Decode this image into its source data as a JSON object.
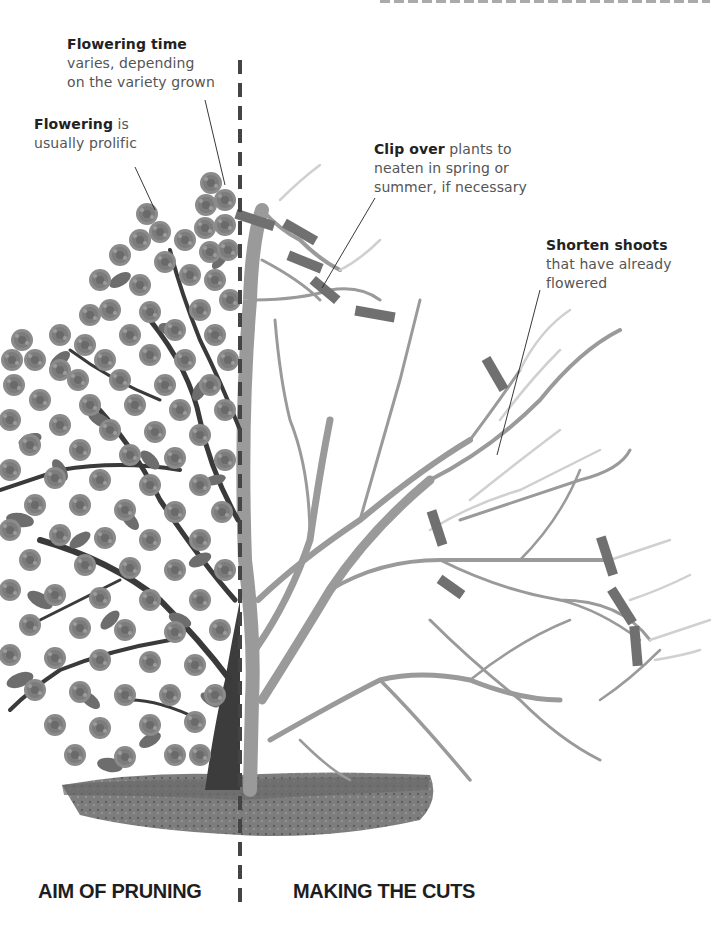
{
  "labels": {
    "flowering_time": {
      "bold": "Flowering time",
      "text_lines": [
        "varies, depending",
        "on the variety grown"
      ]
    },
    "flowering": {
      "bold": "Flowering",
      "inline": " is",
      "text_lines": [
        "usually prolific"
      ]
    },
    "clip_over": {
      "bold": "Clip over",
      "inline": " plants to",
      "text_lines": [
        "neaten in spring or",
        "summer, if necessary"
      ]
    },
    "shorten_shoots": {
      "bold": "Shorten shoots",
      "text_lines": [
        "that have already",
        "flowered"
      ]
    }
  },
  "sections": {
    "left_title": "AIM OF PRUNING",
    "right_title": "MAKING THE CUTS"
  },
  "colors": {
    "flower": "#8a8a8a",
    "leaf": "#6e6e6e",
    "branch_dark": "#3a3a3a",
    "branch_pruned": "#9a9a9a",
    "shoot_light": "#cfcfcf",
    "cut_mark": "#707070",
    "soil": "#7a7a7a",
    "divider": "#444444"
  }
}
